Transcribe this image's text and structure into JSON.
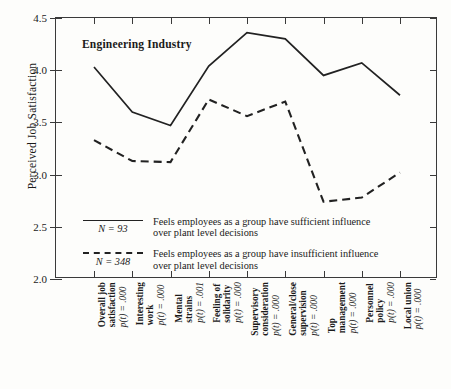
{
  "chart_data": {
    "type": "line",
    "title": "",
    "annotation": "Engineering Industry",
    "xlabel": "",
    "ylabel": "Perceived Job Satisfaction",
    "ylim": [
      2.0,
      4.5
    ],
    "yticks": [
      "2.0",
      "2.5",
      "3.0",
      "3.5",
      "4.0",
      "4.5"
    ],
    "grid": false,
    "legend_position": "inside-lower-left",
    "categories": [
      "Overall job satisfaction",
      "Interesting work",
      "Mental strains",
      "Feeling of solidarity",
      "Supervisory consideration",
      "General/close supervision",
      "Top management",
      "Personnel policy",
      "Local union"
    ],
    "x_tick_labels": [
      {
        "name": "Overall job",
        "name2": "satisfaction",
        "p": "p(t) = .000"
      },
      {
        "name": "Interesting",
        "name2": "work",
        "p": "p(t) = .000"
      },
      {
        "name": "Mental",
        "name2": "strains",
        "p": "p(t) = .001"
      },
      {
        "name": "Feeling of",
        "name2": "solidarity",
        "p": "p(t) = .000"
      },
      {
        "name": "Supervisory",
        "name2": "consideration",
        "p": "p(t) = .000"
      },
      {
        "name": "General/close",
        "name2": "supervision",
        "p": "p(t) = .000"
      },
      {
        "name": "Top",
        "name2": "management",
        "p": "p(t) = .000"
      },
      {
        "name": "Personnel",
        "name2": "policy",
        "p": "p(t) = .000"
      },
      {
        "name": "Local union",
        "name2": "",
        "p": "p(t) = .000"
      }
    ],
    "series": [
      {
        "name": "Feels employees as a group have sufficient influence over plant level decisions",
        "n_label": "N = 93",
        "style": "solid",
        "color": "#222222",
        "values": [
          4.03,
          3.6,
          3.47,
          4.04,
          4.36,
          4.3,
          3.95,
          4.07,
          3.76
        ]
      },
      {
        "name": "Feels employees as a group have insufficient influence over plant level decisions",
        "n_label": "N = 348",
        "style": "dashed",
        "color": "#222222",
        "values": [
          3.33,
          3.13,
          3.12,
          3.72,
          3.56,
          3.7,
          2.74,
          2.78,
          3.02
        ]
      }
    ]
  },
  "legend": {
    "entries": [
      {
        "n_label": "N = 93",
        "line1": "Feels employees as a group have sufficient influence",
        "line2": "over plant level decisions"
      },
      {
        "n_label": "N = 348",
        "line1": "Feels employees as a group have insufficient influence",
        "line2": "over plant level decisions"
      }
    ]
  }
}
